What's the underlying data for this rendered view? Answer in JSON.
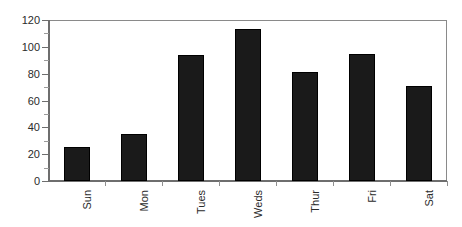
{
  "chart_data": {
    "type": "bar",
    "title": "",
    "subtitle": "",
    "xlabel": "",
    "ylabel": "",
    "categories": [
      "Sun",
      "Mon",
      "Tues",
      "Weds",
      "Thur",
      "Fri",
      "Sat"
    ],
    "values": [
      25,
      35,
      94,
      113,
      81,
      95,
      71
    ],
    "ylim": [
      0,
      120
    ],
    "ytick_labels": [
      "0",
      "20",
      "40",
      "60",
      "80",
      "100",
      "120"
    ],
    "ytick_values": [
      0,
      20,
      40,
      60,
      80,
      100,
      120
    ],
    "yminor_tick_values": [
      10,
      30,
      50,
      70,
      90,
      110
    ],
    "grid": false,
    "legend": null,
    "legend_position": "none",
    "bar_color": "#1a1a1a",
    "axis_color": "#6e6e6e",
    "frame_color": "#8a8a8a",
    "background_color": "#ffffff",
    "xtick_label_rotation": -90
  }
}
